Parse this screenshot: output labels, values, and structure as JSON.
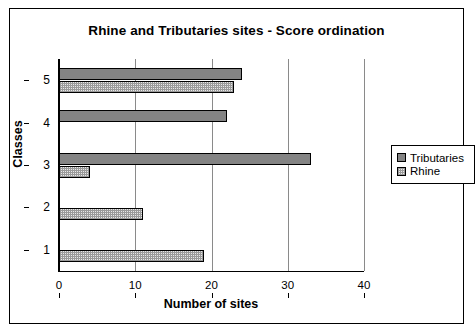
{
  "chart_data": {
    "type": "bar",
    "orientation": "horizontal",
    "title": "Rhine and Tributaries sites - Score ordination",
    "xlabel": "Number of sites",
    "ylabel": "Classes",
    "categories": [
      "1",
      "2",
      "3",
      "4",
      "5"
    ],
    "xlim": [
      0,
      40
    ],
    "xticks": [
      0,
      10,
      20,
      30,
      40
    ],
    "xticklabels": [
      "0",
      "10",
      "20",
      "30",
      "40"
    ],
    "grid": "vertical",
    "legend_position": "right",
    "series": [
      {
        "name": "Tributaries",
        "color": "#848484",
        "fill": "solid",
        "values": [
          0,
          0,
          33,
          22,
          24
        ]
      },
      {
        "name": "Rhine",
        "color": "#e8e8e8",
        "fill": "checkered-hatch",
        "values": [
          19,
          11,
          4,
          0,
          23
        ]
      }
    ]
  },
  "legend": {
    "items": [
      {
        "label": "Tributaries"
      },
      {
        "label": "Rhine"
      }
    ]
  }
}
